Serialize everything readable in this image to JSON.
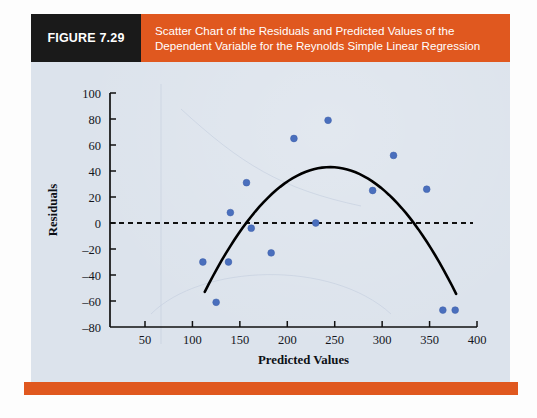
{
  "figure": {
    "tag_label": "FIGURE 7.29",
    "title_line1": "Scatter Chart of the Residuals and Predicted Values of the",
    "title_line2": "Dependent Variable for the Reynolds Simple Linear Regression",
    "banner_color": "#e0581f",
    "tag_background": "#1a1a1a",
    "panel_color": "#dce3ec",
    "marker_color": "#4a6fbd",
    "curve_color": "#000000"
  },
  "chart_data": {
    "type": "scatter",
    "title": "Scatter Chart of the Residuals and Predicted Values of the Dependent Variable for the Reynolds Simple Linear Regression",
    "xlabel": "Predicted Values",
    "ylabel": "Residuals",
    "xlim": [
      0,
      400
    ],
    "ylim": [
      -80,
      100
    ],
    "xticks": [
      50,
      100,
      150,
      200,
      250,
      300,
      350,
      400
    ],
    "yticks": [
      -80,
      -60,
      -40,
      -20,
      0,
      20,
      40,
      60,
      80,
      100
    ],
    "grid": false,
    "legend": "none",
    "reference_line": {
      "type": "horizontal-dashed",
      "y": 0
    },
    "points": [
      {
        "x": 111,
        "y": -30
      },
      {
        "x": 125,
        "y": -61
      },
      {
        "x": 138,
        "y": -30
      },
      {
        "x": 140,
        "y": 8
      },
      {
        "x": 157,
        "y": 31
      },
      {
        "x": 162,
        "y": -4
      },
      {
        "x": 183,
        "y": -23
      },
      {
        "x": 207,
        "y": 65
      },
      {
        "x": 230,
        "y": 0
      },
      {
        "x": 243,
        "y": 79
      },
      {
        "x": 290,
        "y": 25
      },
      {
        "x": 312,
        "y": 52
      },
      {
        "x": 347,
        "y": 26
      },
      {
        "x": 364,
        "y": -67
      },
      {
        "x": 377,
        "y": -67
      }
    ],
    "trend_curve": {
      "shape": "quadratic",
      "x_start": 113,
      "x_end": 378,
      "vertex_x": 245,
      "vertex_y": 43,
      "y_start": -53,
      "y_end": -53
    }
  }
}
